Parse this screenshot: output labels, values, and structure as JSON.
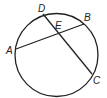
{
  "diagram": {
    "type": "circle-intersecting-chords",
    "circle": {
      "cx": 56.5,
      "cy": 55,
      "r": 41.5
    },
    "points": {
      "A": {
        "x": 16,
        "y": 49,
        "label": "A"
      },
      "B": {
        "x": 84,
        "y": 24,
        "label": "B"
      },
      "C": {
        "x": 92,
        "y": 74,
        "label": "C"
      },
      "D": {
        "x": 43,
        "y": 14,
        "label": "D"
      },
      "E": {
        "x": 58,
        "y": 33,
        "label": "E"
      }
    },
    "chords": [
      {
        "from": "A",
        "to": "B"
      },
      {
        "from": "D",
        "to": "C"
      }
    ],
    "stroke_color": "#222222"
  }
}
